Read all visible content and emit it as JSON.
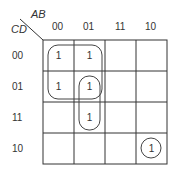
{
  "kmap": {
    "row_var": "CD",
    "col_var": "AB",
    "col_labels": [
      "00",
      "01",
      "11",
      "10"
    ],
    "row_labels": [
      "00",
      "01",
      "11",
      "10"
    ],
    "cells": [
      [
        "1",
        "1",
        "",
        ""
      ],
      [
        "1",
        "1",
        "",
        ""
      ],
      [
        "",
        "1",
        "",
        ""
      ],
      [
        "",
        "",
        "",
        "1"
      ]
    ],
    "groups": [
      {
        "name": "quad-group",
        "cells": "rows 00-01, cols 00-01"
      },
      {
        "name": "pair-group",
        "cells": "rows 01-11, col 01"
      },
      {
        "name": "single-group",
        "cells": "row 10, col 10"
      }
    ]
  }
}
